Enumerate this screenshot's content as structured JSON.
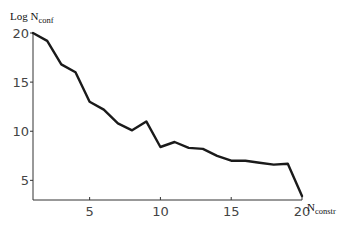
{
  "chart_data": {
    "type": "line",
    "title": "",
    "xlabel": {
      "main": "N",
      "sub": "constr"
    },
    "ylabel": {
      "main": "Log N",
      "sub": "conf"
    },
    "x": [
      1,
      2,
      3,
      4,
      5,
      6,
      7,
      8,
      9,
      10,
      11,
      12,
      13,
      14,
      15,
      16,
      17,
      18,
      19,
      20
    ],
    "series": [
      {
        "name": "Log N_conf",
        "values": [
          20.0,
          19.2,
          16.8,
          16.0,
          13.0,
          12.2,
          10.8,
          10.1,
          11.0,
          8.4,
          8.9,
          8.3,
          8.2,
          7.5,
          7.0,
          7.0,
          6.8,
          6.6,
          6.7,
          3.4
        ]
      }
    ],
    "xlim": [
      1,
      20
    ],
    "ylim": [
      3,
      20
    ],
    "xticks": [
      5,
      10,
      15,
      20
    ],
    "yticks": [
      5,
      10,
      15,
      20
    ],
    "xtick_labels": [
      "5",
      "10",
      "15",
      "20"
    ],
    "ytick_labels": [
      "5",
      "10",
      "15",
      "20"
    ],
    "grid": false,
    "legend": "none"
  }
}
